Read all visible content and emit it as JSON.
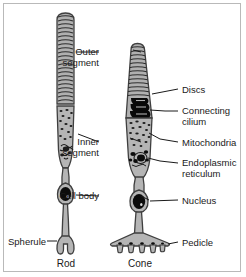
{
  "figure": {
    "background_color": "#ffffff",
    "frame_color": "#b9b9b9",
    "cell_fill_color": "#b5b5b5",
    "cell_outline_color": "#4a4a4a",
    "organelle_color": "#111111",
    "label_color": "#1a1a1a"
  },
  "labels": {
    "outer_segment_line1": "Outer",
    "outer_segment_line2": "segment",
    "inner_segment_line1": "Inner",
    "inner_segment_line2": "segment",
    "cell_body": "Cell body",
    "discs": "Discs",
    "connecting_cilium_line1": "Connecting",
    "connecting_cilium_line2": "cilium",
    "mitochondria": "Mitochondria",
    "endoplasmic_reticulum_line1": "Endoplasmic",
    "endoplasmic_reticulum_line2": "reticulum",
    "nucleus": "Nucleus",
    "pedicle": "Pedicle",
    "spherule": "Spherule"
  },
  "cells": {
    "rod_name": "Rod",
    "cone_name": "Cone"
  },
  "structures": [
    "rod-outer-segment",
    "rod-inner-segment",
    "rod-cell-body",
    "rod-spherule",
    "cone-outer-segment",
    "cone-connecting-cilium",
    "cone-inner-segment",
    "cone-mitochondria",
    "cone-endoplasmic-reticulum",
    "cone-nucleus",
    "cone-pedicle"
  ]
}
